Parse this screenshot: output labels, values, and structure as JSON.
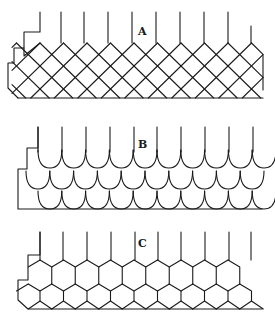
{
  "figure": {
    "panels": [
      {
        "id": "A",
        "label": "A",
        "pattern": "diamond slate lattice"
      },
      {
        "id": "B",
        "label": "B",
        "pattern": "fish-scale (rounded) shingles"
      },
      {
        "id": "C",
        "label": "C",
        "pattern": "hexagonal shingles"
      }
    ],
    "colors": {
      "ink": "#1a1a1a",
      "background": "#ffffff"
    }
  }
}
